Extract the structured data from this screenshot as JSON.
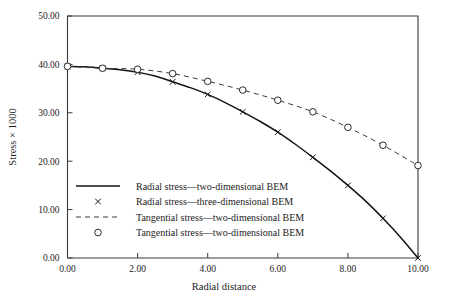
{
  "chart_data": {
    "type": "line",
    "title": "",
    "xlabel": "Radial distance",
    "ylabel": "Stress × 1000",
    "xlim": [
      0,
      10
    ],
    "ylim": [
      0,
      50
    ],
    "xticks": [
      0,
      2,
      4,
      6,
      8,
      10
    ],
    "xtick_labels": [
      "0.00",
      "2.00",
      "4.00",
      "6.00",
      "8.00",
      "10.00"
    ],
    "yticks": [
      0,
      10,
      20,
      30,
      40,
      50
    ],
    "ytick_labels": [
      "0.00",
      "10.00",
      "20.00",
      "30.00",
      "40.00",
      "50.00"
    ],
    "grid": false,
    "legend_position": "lower-left-inside",
    "series": [
      {
        "name": "Radial stress—two-dimensional BEM",
        "style": "solid",
        "marker": "none",
        "color": "#141414",
        "x": [
          0,
          0.5,
          1,
          1.5,
          2,
          2.5,
          3,
          3.5,
          4,
          4.5,
          5,
          5.5,
          6,
          6.5,
          7,
          7.5,
          8,
          8.5,
          9,
          9.5,
          10
        ],
        "y": [
          39.6,
          39.5,
          39.2,
          38.9,
          38.4,
          37.6,
          36.4,
          35.2,
          33.8,
          32.1,
          30.2,
          28.2,
          26.0,
          23.5,
          20.8,
          18.0,
          15.0,
          11.8,
          8.2,
          4.3,
          0.0
        ]
      },
      {
        "name": "Radial stress—three-dimensional BEM",
        "style": "none",
        "marker": "x",
        "color": "#141414",
        "x": [
          0,
          1,
          2,
          3,
          4,
          5,
          6,
          7,
          8,
          9,
          10
        ],
        "y": [
          39.6,
          39.2,
          38.4,
          36.4,
          33.8,
          30.2,
          26.0,
          20.8,
          15.0,
          8.2,
          0.0
        ]
      },
      {
        "name": "Tangential stress—two-dimensional BEM",
        "style": "dashed",
        "marker": "none",
        "color": "#3d3d3d",
        "x": [
          0,
          1,
          2,
          3,
          4,
          5,
          6,
          7,
          8,
          9,
          10
        ],
        "y": [
          39.6,
          39.2,
          39.0,
          38.1,
          36.5,
          34.7,
          32.6,
          30.2,
          27.0,
          23.3,
          19.1
        ]
      },
      {
        "name": "Tangential stress—two-dimensional BEM",
        "style": "none",
        "marker": "o",
        "color": "#2a2a2a",
        "x": [
          0,
          1,
          2,
          3,
          4,
          5,
          6,
          7,
          8,
          9,
          10
        ],
        "y": [
          39.6,
          39.2,
          39.0,
          38.1,
          36.5,
          34.7,
          32.6,
          30.2,
          27.0,
          23.3,
          19.1
        ]
      }
    ],
    "legend": [
      {
        "label": "Radial stress—two-dimensional BEM",
        "sample": "solid-line"
      },
      {
        "label": "Radial stress—three-dimensional BEM",
        "sample": "x-marker"
      },
      {
        "label": "Tangential stress—two-dimensional BEM",
        "sample": "dashed-line"
      },
      {
        "label": "Tangential stress—two-dimensional BEM",
        "sample": "circle-marker"
      }
    ]
  }
}
